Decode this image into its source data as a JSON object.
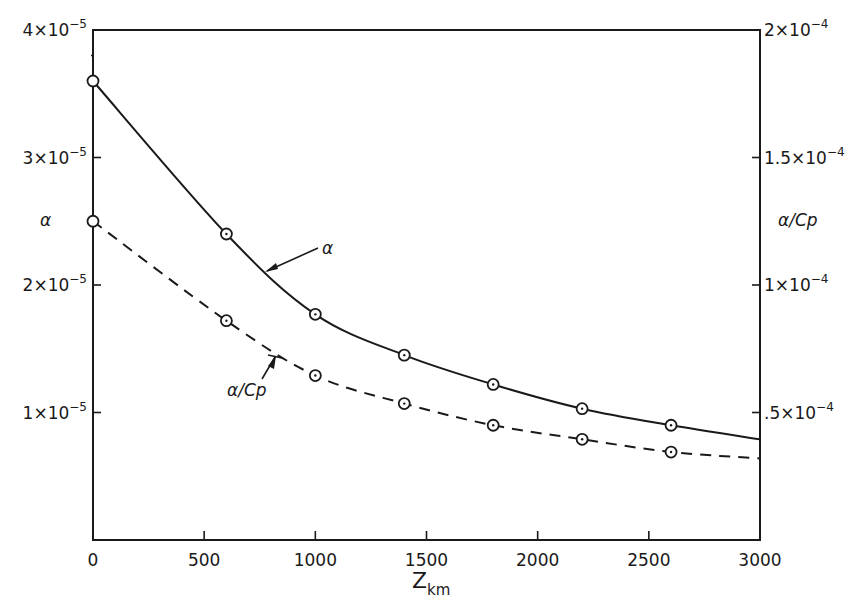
{
  "chart_data": {
    "type": "line",
    "title": "",
    "xlabel": "Z_km",
    "xlabel_main": "Z",
    "xlabel_sub": "km",
    "ylabel_left": "α",
    "ylabel_right": "α/Cp",
    "xlim": [
      0,
      3000
    ],
    "ylim_left": [
      0,
      4e-05
    ],
    "ylim_right": [
      0,
      0.0002
    ],
    "grid": false,
    "legend": "none (curves labeled with pointer arrows)",
    "x_ticks": [
      {
        "value": 0,
        "label": "0"
      },
      {
        "value": 500,
        "label": "500"
      },
      {
        "value": 1000,
        "label": "1000"
      },
      {
        "value": 1500,
        "label": "1500"
      },
      {
        "value": 2000,
        "label": "2000"
      },
      {
        "value": 2500,
        "label": "2500"
      },
      {
        "value": 3000,
        "label": "3000"
      }
    ],
    "y_left_ticks": [
      {
        "value": 1e-05,
        "mant": "1",
        "exp": "-5"
      },
      {
        "value": 2e-05,
        "mant": "2",
        "exp": "-5"
      },
      {
        "value": 3e-05,
        "mant": "3",
        "exp": "-5"
      },
      {
        "value": 4e-05,
        "mant": "4",
        "exp": "-5"
      }
    ],
    "y_right_ticks": [
      {
        "value": 5e-05,
        "mant": ".5",
        "exp": "-4"
      },
      {
        "value": 0.0001,
        "mant": "1",
        "exp": "-4"
      },
      {
        "value": 0.00015,
        "mant": "1.5",
        "exp": "-4"
      },
      {
        "value": 0.0002,
        "mant": "2",
        "exp": "-4"
      }
    ],
    "series": [
      {
        "name": "α",
        "axis": "left",
        "style": "solid",
        "markers_x": [
          0,
          600,
          1000,
          1400,
          1800,
          2200,
          2600
        ],
        "markers_y": [
          3.6e-05,
          2.4e-05,
          1.77e-05,
          1.45e-05,
          1.22e-05,
          1.03e-05,
          9e-06
        ],
        "curve_end": {
          "x": 3000,
          "y": 7.9e-06
        },
        "label": "α",
        "label_pos": {
          "x": 800,
          "y": 2.65e-05
        }
      },
      {
        "name": "α/Cp",
        "axis": "right",
        "style": "dashed",
        "markers_x": [
          0,
          600,
          1000,
          1400,
          1800,
          2200,
          2600
        ],
        "markers_y": [
          0.000125,
          8.6e-05,
          6.45e-05,
          5.35e-05,
          4.5e-05,
          3.95e-05,
          3.45e-05
        ],
        "curve_end": {
          "x": 3000,
          "y": 3.2e-05
        },
        "label": "α/Cp",
        "label_pos": {
          "x": 320,
          "y": 6.5e-05
        }
      }
    ]
  }
}
